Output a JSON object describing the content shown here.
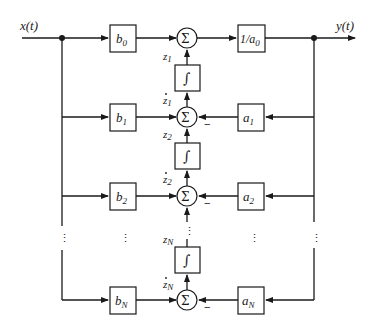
{
  "diagram": {
    "type": "block-diagram",
    "title": "",
    "input": {
      "label": "x(t)"
    },
    "output": {
      "label": "y(t)"
    },
    "feedforward_gains": [
      {
        "base": "b",
        "sub": "0"
      },
      {
        "base": "b",
        "sub": "1"
      },
      {
        "base": "b",
        "sub": "2"
      },
      {
        "base": "b",
        "sub": "N"
      }
    ],
    "feedback_gains": [
      {
        "base": "a",
        "sub": "1"
      },
      {
        "base": "a",
        "sub": "2"
      },
      {
        "base": "a",
        "sub": "N"
      }
    ],
    "output_gain": {
      "text": "1/a",
      "sub": "0"
    },
    "summer_symbol": "Σ",
    "integrator_symbol": "∫",
    "states": [
      {
        "base": "z",
        "sub": "1",
        "dot": false
      },
      {
        "base": "z",
        "sub": "1",
        "dot": true
      },
      {
        "base": "z",
        "sub": "2",
        "dot": false
      },
      {
        "base": "z",
        "sub": "2",
        "dot": true
      },
      {
        "base": "z",
        "sub": "N",
        "dot": false
      },
      {
        "base": "z",
        "sub": "N",
        "dot": true
      }
    ],
    "minus_sign": "−",
    "ellipsis": "⋮"
  }
}
